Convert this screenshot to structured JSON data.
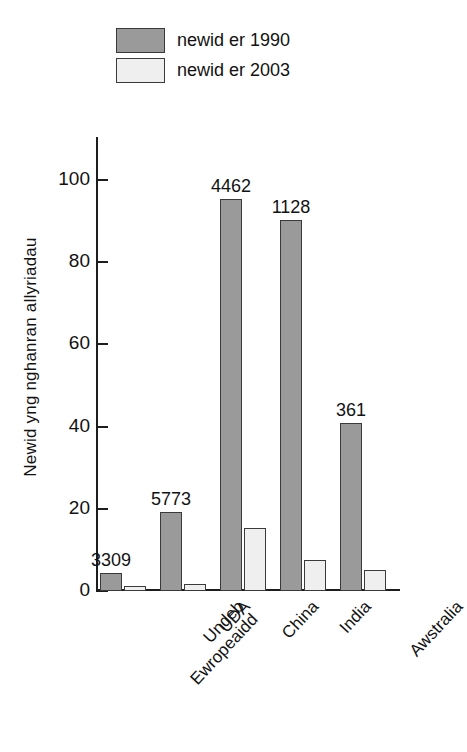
{
  "chart_data": {
    "type": "bar",
    "title": "",
    "xlabel": "",
    "ylabel": "Newid yng nghanran allyriadau",
    "ylim": [
      0,
      110
    ],
    "yticks": [
      0,
      20,
      40,
      60,
      80,
      100
    ],
    "ytick_labels": [
      "0",
      "20",
      "40",
      "60",
      "80",
      "100"
    ],
    "grid": false,
    "legend_position": "top-left",
    "categories": [
      "Undeb Ewropeaidd",
      "UDA",
      "China",
      "India",
      "Awstralia"
    ],
    "category_lines": [
      [
        "Undeb",
        "Ewropeaidd"
      ],
      [
        "UDA"
      ],
      [
        "China"
      ],
      [
        "India"
      ],
      [
        "Awstralia"
      ]
    ],
    "series": [
      {
        "name": "newid er 1990",
        "color": "#9a9a9a",
        "values": [
          4.5,
          19.3,
          95.3,
          90.2,
          40.8
        ],
        "point_labels": [
          "3309",
          "5773",
          "4462",
          "1128",
          "361"
        ]
      },
      {
        "name": "newid er 2003",
        "color": "#efefef",
        "values": [
          1.3,
          1.8,
          15.3,
          7.6,
          5.0
        ],
        "point_labels": [
          "",
          "",
          "",
          "",
          ""
        ]
      }
    ]
  },
  "legend": {
    "items": [
      {
        "label": "newid er 1990",
        "color": "#9a9a9a"
      },
      {
        "label": "newid er 2003",
        "color": "#efefef"
      }
    ]
  },
  "axes": {
    "y_title": "Newid yng nghanran allyriadau"
  }
}
